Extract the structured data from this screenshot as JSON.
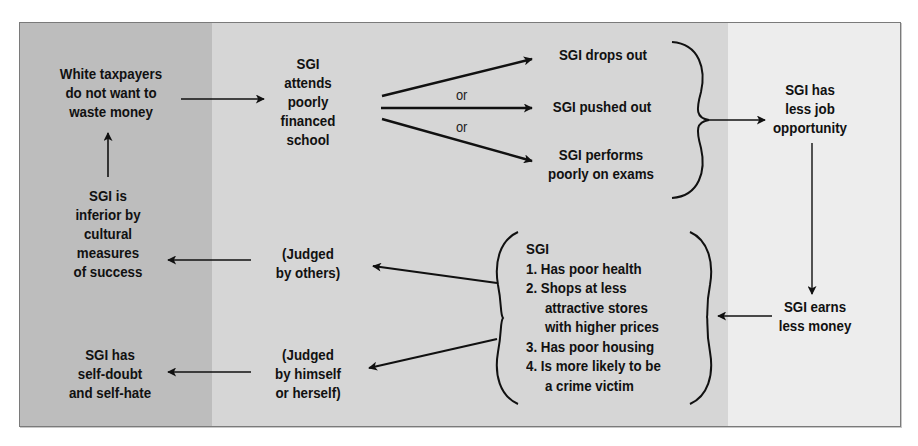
{
  "diagram": {
    "colors": {
      "panel_dark": "#bdbdbd",
      "panel_mid": "#d6d6d6",
      "panel_light": "#ededed",
      "ink": "#111111"
    },
    "nodes": {
      "taxpayers": [
        "White taxpayers",
        "do not want to",
        "waste money"
      ],
      "attends_school": [
        "SGI",
        "attends",
        "poorly",
        "financed",
        "school"
      ],
      "drops_out": [
        "SGI drops out"
      ],
      "pushed_out": [
        "SGI pushed out"
      ],
      "performs_poorly": [
        "SGI performs",
        "poorly on exams"
      ],
      "less_job": [
        "SGI has",
        "less job",
        "opportunity"
      ],
      "earns_less": [
        "SGI earns",
        "less money"
      ],
      "consequences": [
        "SGI",
        "1. Has poor health",
        "2. Shops at less",
        "attractive stores",
        "with higher prices",
        "3. Has poor housing",
        "4. Is more likely to be",
        "a crime victim"
      ],
      "judged_others": [
        "(Judged",
        "by others)"
      ],
      "judged_self": [
        "(Judged",
        "by himself",
        "or herself)"
      ],
      "inferior": [
        "SGI is",
        "inferior by",
        "cultural",
        "measures",
        "of success"
      ],
      "self_doubt": [
        "SGI has",
        "self-doubt",
        "and self-hate"
      ]
    },
    "connector_labels": {
      "or_1": "or",
      "or_2": "or"
    },
    "edges": [
      {
        "from": "taxpayers",
        "to": "attends_school"
      },
      {
        "from": "attends_school",
        "to": "drops_out"
      },
      {
        "from": "attends_school",
        "to": "pushed_out"
      },
      {
        "from": "attends_school",
        "to": "performs_poorly"
      },
      {
        "from": "drops_out|pushed_out|performs_poorly",
        "to": "less_job"
      },
      {
        "from": "less_job",
        "to": "earns_less"
      },
      {
        "from": "earns_less",
        "to": "consequences"
      },
      {
        "from": "consequences",
        "to": "judged_others"
      },
      {
        "from": "consequences",
        "to": "judged_self"
      },
      {
        "from": "judged_others",
        "to": "inferior"
      },
      {
        "from": "judged_self",
        "to": "self_doubt"
      },
      {
        "from": "inferior",
        "to": "taxpayers"
      }
    ]
  }
}
